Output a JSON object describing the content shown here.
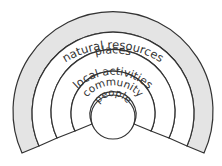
{
  "diagram": {
    "type": "concentric-semicircles",
    "colors": {
      "stroke": "#333333",
      "outer_band_fill": "#e4e4e4",
      "inner_fill": "#ffffff",
      "text": "#333333"
    },
    "rings": [
      {
        "label": "natural resources",
        "shaded": true
      },
      {
        "label": "places",
        "shaded": false
      },
      {
        "label": "local activities",
        "shaded": false
      },
      {
        "label": "community",
        "shaded": false
      },
      {
        "label": "people",
        "shaded": false
      }
    ]
  }
}
